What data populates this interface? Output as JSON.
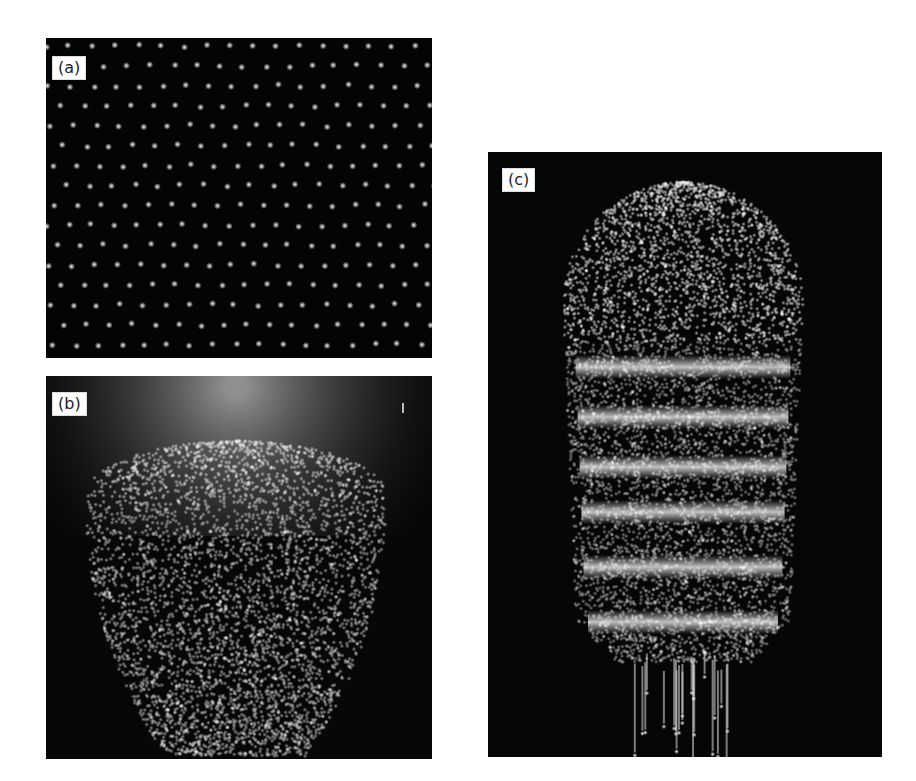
{
  "figure": {
    "panels": [
      {
        "id": "a",
        "label": "(a)",
        "description": "hexagonal lattice of bright dots on black background"
      },
      {
        "id": "b",
        "label": "(b)",
        "description": "rounded cluster of dots, dense cap over patterned lower body"
      },
      {
        "id": "c",
        "label": "(c)",
        "description": "elongated capsule-shaped cluster with horizontal bright bands and trailing streaks"
      }
    ],
    "colors": {
      "background": "#ffffff",
      "panel_background": "#050505",
      "dots": "#f2f2f2",
      "label_background": "#ffffff",
      "label_text": "#222222"
    }
  }
}
